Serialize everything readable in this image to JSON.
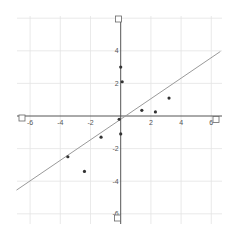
{
  "chart_data": {
    "type": "scatter",
    "title": "",
    "xlabel": "",
    "ylabel": "",
    "xlim": [
      -6.8,
      6.4
    ],
    "ylim": [
      -6.4,
      6.0
    ],
    "grid": true,
    "legend": null,
    "x_ticks": [
      -6,
      -4,
      -2,
      2,
      4,
      6
    ],
    "y_ticks": [
      4,
      2,
      -2,
      -4,
      -6
    ],
    "x_tick_labels": [
      "-6",
      "-4",
      "-2",
      "2",
      "4",
      "6"
    ],
    "y_tick_labels": [
      "4",
      "2",
      "-2",
      "-4",
      "-6"
    ],
    "series": [
      {
        "name": "points",
        "type": "scatter",
        "x": [
          0.0,
          0.1,
          1.4,
          2.3,
          3.2,
          -0.1,
          0.0,
          -1.3,
          -3.5,
          -2.4
        ],
        "y": [
          3.0,
          2.1,
          0.35,
          0.25,
          1.1,
          -0.2,
          -1.1,
          -1.3,
          -2.5,
          -3.4
        ]
      },
      {
        "name": "fit-line",
        "type": "line",
        "slope": 0.63,
        "intercept": -0.2,
        "x_range": [
          -6.9,
          6.6
        ]
      }
    ],
    "axis_handles": [
      "x-min",
      "x-max",
      "y-min",
      "y-max"
    ]
  },
  "colors": {
    "axis": "#555555",
    "grid": "#e4e4e4",
    "point": "#333333",
    "line": "#9a9a9a",
    "handle": "#666666"
  }
}
